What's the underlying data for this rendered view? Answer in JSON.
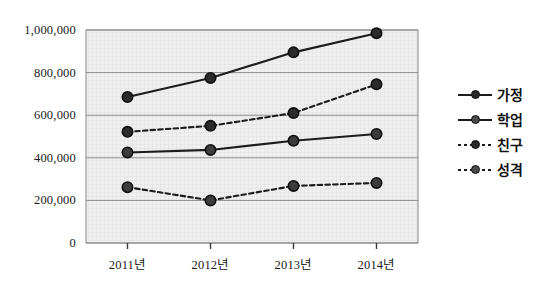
{
  "chart_data": {
    "type": "line",
    "title": "",
    "xlabel": "",
    "ylabel": "",
    "categories": [
      "2011년",
      "2012년",
      "2013년",
      "2014년"
    ],
    "ylim": [
      0,
      1000000
    ],
    "ytick_values": [
      0,
      200000,
      400000,
      600000,
      800000,
      1000000
    ],
    "ytick_labels": [
      "0",
      "200,000",
      "400,000",
      "600,000",
      "800,000",
      "1,000,000"
    ],
    "grid": true,
    "legend_position": "right",
    "series": [
      {
        "name": "가정",
        "style": "solid",
        "marker": "circle",
        "color": "#1c1c1c",
        "values": [
          685000,
          775000,
          895000,
          985000
        ]
      },
      {
        "name": "학업",
        "style": "solid",
        "marker": "circle",
        "color": "#1c1c1c",
        "values": [
          425000,
          437000,
          480000,
          512000
        ]
      },
      {
        "name": "친구",
        "style": "dashed",
        "marker": "circle",
        "color": "#1c1c1c",
        "values": [
          522000,
          550000,
          610000,
          745000
        ]
      },
      {
        "name": "성격",
        "style": "dashed",
        "marker": "circle",
        "color": "#1c1c1c",
        "values": [
          262000,
          200000,
          268000,
          282000
        ]
      }
    ]
  },
  "plot": {
    "left": 86,
    "right": 418,
    "top": 30,
    "bottom": 243,
    "background": "#efefef",
    "border_color": "#8a8a8a",
    "gridline_color": "#8d8d8d"
  }
}
